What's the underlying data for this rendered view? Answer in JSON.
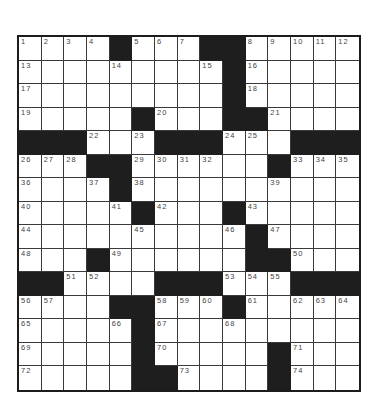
{
  "puzzle": {
    "size": {
      "rows": 15,
      "cols": 15
    },
    "colors": {
      "block": "#1e1e1e",
      "cell": "#ffffff",
      "line": "#3a3a3a",
      "number": "#444444"
    },
    "grid": [
      [
        "1",
        "2",
        "3",
        "4",
        "#",
        "5",
        "6",
        "7",
        "#",
        "#",
        "8",
        "9",
        "10",
        "11",
        "12"
      ],
      [
        "13",
        ".",
        ".",
        ".",
        "14",
        ".",
        ".",
        ".",
        "15",
        "#",
        "16",
        ".",
        ".",
        ".",
        "."
      ],
      [
        "17",
        ".",
        ".",
        ".",
        ".",
        ".",
        ".",
        ".",
        ".",
        "#",
        "18",
        ".",
        ".",
        ".",
        "."
      ],
      [
        "19",
        ".",
        ".",
        ".",
        ".",
        "#",
        "20",
        ".",
        ".",
        "#",
        "#",
        "21",
        ".",
        ".",
        "."
      ],
      [
        "#",
        "#",
        "#",
        "22",
        ".",
        "23",
        "#",
        "#",
        "#",
        "24",
        "25",
        ".",
        "#",
        "#",
        "#"
      ],
      [
        "26",
        "27",
        "28",
        "#",
        "#",
        "29",
        "30",
        "31",
        "32",
        ".",
        ".",
        "#",
        "33",
        "34",
        "35"
      ],
      [
        "36",
        ".",
        ".",
        "37",
        "#",
        "38",
        ".",
        ".",
        ".",
        ".",
        ".",
        "39",
        ".",
        ".",
        "."
      ],
      [
        "40",
        ".",
        ".",
        ".",
        "41",
        "#",
        "42",
        ".",
        ".",
        "#",
        "43",
        ".",
        ".",
        ".",
        "."
      ],
      [
        "44",
        ".",
        ".",
        ".",
        ".",
        "45",
        ".",
        ".",
        ".",
        "46",
        "#",
        "47",
        ".",
        ".",
        "."
      ],
      [
        "48",
        ".",
        ".",
        "#",
        "49",
        ".",
        ".",
        ".",
        ".",
        ".",
        "#",
        "#",
        "50",
        ".",
        "."
      ],
      [
        "#",
        "#",
        "51",
        "52",
        ".",
        ".",
        "#",
        "#",
        "#",
        "53",
        "54",
        "55",
        "#",
        "#",
        "#"
      ],
      [
        "56",
        "57",
        ".",
        ".",
        "#",
        "#",
        "58",
        "59",
        "60",
        "#",
        "61",
        ".",
        "62",
        "63",
        "64"
      ],
      [
        "65",
        ".",
        ".",
        ".",
        "66",
        "#",
        "67",
        ".",
        ".",
        "68",
        ".",
        ".",
        ".",
        ".",
        "."
      ],
      [
        "69",
        ".",
        ".",
        ".",
        ".",
        "#",
        "70",
        ".",
        ".",
        ".",
        ".",
        "#",
        "71",
        ".",
        "."
      ],
      [
        "72",
        ".",
        ".",
        ".",
        ".",
        "#",
        "#",
        "73",
        ".",
        ".",
        ".",
        "#",
        "74",
        ".",
        "."
      ]
    ]
  }
}
